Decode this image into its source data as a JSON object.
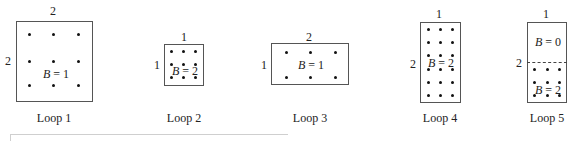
{
  "figure": {
    "loops": [
      {
        "caption": "Loop 1",
        "top_label": "2",
        "side_label": "2",
        "regions": [
          {
            "B_var": "B",
            "eq": " = 1"
          }
        ]
      },
      {
        "caption": "Loop 2",
        "top_label": "1",
        "side_label": "1",
        "regions": [
          {
            "B_var": "B",
            "eq": " = 2"
          }
        ]
      },
      {
        "caption": "Loop 3",
        "top_label": "2",
        "side_label": "1",
        "regions": [
          {
            "B_var": "B",
            "eq": " = 1"
          }
        ]
      },
      {
        "caption": "Loop 4",
        "top_label": "1",
        "side_label": "2",
        "regions": [
          {
            "B_var": "B",
            "eq": " = 2"
          }
        ]
      },
      {
        "caption": "Loop 5",
        "top_label": "1",
        "side_label": "2",
        "regions": [
          {
            "B_var": "B",
            "eq": " = 0"
          },
          {
            "B_var": "B",
            "eq": " = 2"
          }
        ]
      }
    ]
  }
}
